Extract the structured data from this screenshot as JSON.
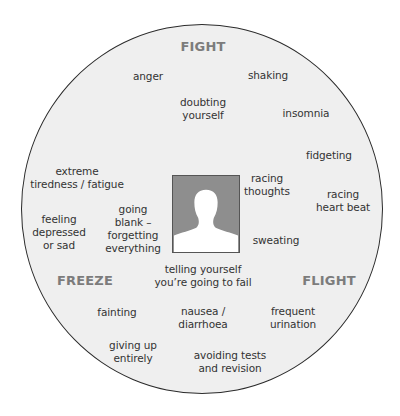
{
  "diagram": {
    "categories": {
      "fight": "FIGHT",
      "freeze": "FREEZE",
      "flight": "FLIGHT"
    },
    "symptoms": [
      {
        "id": "anger",
        "text": "anger"
      },
      {
        "id": "shaking",
        "text": "shaking"
      },
      {
        "id": "doubting",
        "text": "doubting\nyourself"
      },
      {
        "id": "insomnia",
        "text": "insomnia"
      },
      {
        "id": "fatigue",
        "text": "extreme\ntiredness / fatigue"
      },
      {
        "id": "fidgeting",
        "text": "fidgeting"
      },
      {
        "id": "racing_thoughts",
        "text": "racing\nthoughts"
      },
      {
        "id": "racing_heart",
        "text": "racing\nheart beat"
      },
      {
        "id": "depressed",
        "text": "feeling\ndepressed\nor sad"
      },
      {
        "id": "going_blank",
        "text": "going\nblank –\nforgetting\neverything"
      },
      {
        "id": "sweating",
        "text": "sweating"
      },
      {
        "id": "telling_fail",
        "text": "telling yourself\nyou’re going to fail"
      },
      {
        "id": "fainting",
        "text": "fainting"
      },
      {
        "id": "nausea",
        "text": "nausea /\ndiarrhoea"
      },
      {
        "id": "urination",
        "text": "frequent\nurination"
      },
      {
        "id": "giving_up",
        "text": "giving up\nentirely"
      },
      {
        "id": "avoiding",
        "text": "avoiding tests\nand revision"
      }
    ],
    "center_image": "person-silhouette-icon",
    "colors": {
      "circle_fill": "#efefef",
      "circle_stroke": "#2a2a2a",
      "heading": "#7c7c7c",
      "text": "#333333",
      "portrait_bg": "#8e8e8e"
    }
  }
}
